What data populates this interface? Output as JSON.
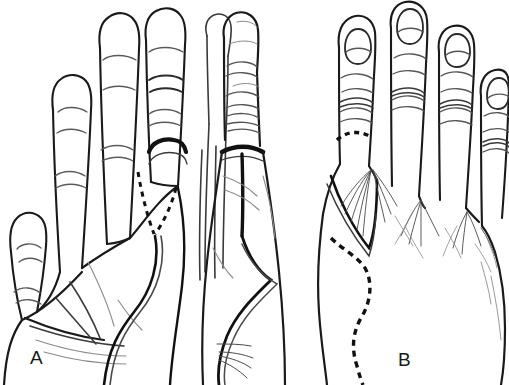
{
  "figure": {
    "kind": "line-drawing-illustration",
    "background_color": "#ffffff",
    "ink_color": "#1a1a1a",
    "mid_ink_color": "#555555",
    "light_ink_color": "#8a8a8a",
    "width_px": 509,
    "height_px": 385,
    "panel_count": 3
  },
  "panels": [
    {
      "id": "A",
      "label": "A",
      "view": "palmar",
      "description": "Palmar (volar) view of the left hand showing four fingers, thenar eminence and a dashed V-shaped incision marking at the base of the index finger continuing as a curved flap line toward the wrist",
      "digits_visible": 4,
      "nails_visible": false,
      "markings": [
        {
          "name": "dashed-v-incision",
          "style": "dashed",
          "location": "index finger base / distal palm"
        },
        {
          "name": "thick-proximal-band",
          "style": "solid-thick",
          "location": "index finger proximal crease"
        },
        {
          "name": "curved-flap-outline",
          "style": "solid",
          "location": "radial border of palm to wrist"
        },
        {
          "name": "distal-palmar-crease",
          "style": "solid-thin",
          "location": "mid palm"
        },
        {
          "name": "thenar-crease",
          "style": "solid-thin",
          "location": "thenar eminence"
        },
        {
          "name": "wrist-crease",
          "style": "solid-thin",
          "location": "distal wrist"
        }
      ]
    },
    {
      "id": "B",
      "label": "B",
      "view": "lateral",
      "description": "Lateral (radial) view of the hand and index finger with adjacent digits behind, showing a thick transverse band at the finger base, a vertical midaxial line and a long curved flap incision running along the side of the hand",
      "digits_visible": 4,
      "nails_visible": false,
      "markings": [
        {
          "name": "thick-transverse-band",
          "style": "solid-thick",
          "location": "proximal phalanx base"
        },
        {
          "name": "midaxial-line",
          "style": "solid-thick",
          "location": "descending from band"
        },
        {
          "name": "curved-flap-outline",
          "style": "solid",
          "location": "radial side of hand to wrist"
        },
        {
          "name": "interphalangeal-creases",
          "style": "solid-thin",
          "location": "finger joints"
        }
      ]
    },
    {
      "id": "C",
      "label": "C",
      "view": "dorsal",
      "description": "Dorsal view of the hand with four fingernails visible, a dashed transverse line across the dorsum of the index proximal phalanx, a triangular flap outlined over the first web space, radiating extensor/hair strokes over the metacarpals, and a long S-shaped dashed incision line over the dorsoradial hand",
      "digits_visible": 4,
      "nails_visible": true,
      "markings": [
        {
          "name": "dashed-transverse-line",
          "style": "dashed",
          "location": "dorsum of index proximal phalanx"
        },
        {
          "name": "triangular-flap",
          "style": "solid",
          "location": "first web space / index metacarpal"
        },
        {
          "name": "s-shaped-dashed-incision",
          "style": "dashed",
          "location": "dorsoradial hand to wrist"
        },
        {
          "name": "radiating-extensor-strokes",
          "style": "solid-hairline",
          "location": "dorsum over metacarpals"
        },
        {
          "name": "knuckle-wrinkles",
          "style": "solid-thin",
          "location": "metacarpophalangeal joints"
        }
      ]
    }
  ],
  "labels": {
    "panel_a": "A",
    "panel_b": "B",
    "panel_c": "C"
  }
}
